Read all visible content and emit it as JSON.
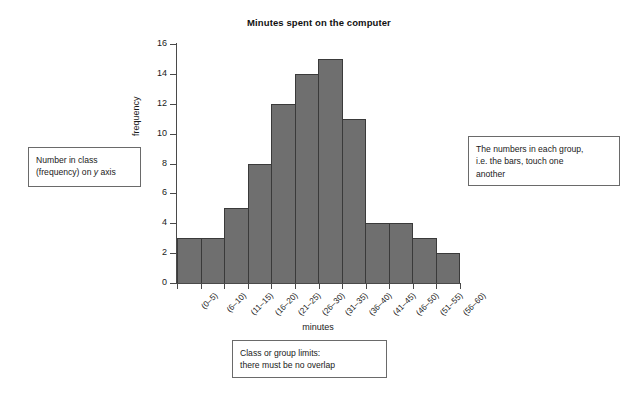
{
  "chart_data": {
    "type": "bar",
    "title": "Minutes spent on the computer",
    "xlabel": "minutes",
    "ylabel": "frequency",
    "categories": [
      "(0–5)",
      "(6–10)",
      "(11–15)",
      "(16–20)",
      "(21–25)",
      "(26–30)",
      "(31–35)",
      "(36–40)",
      "(41–45)",
      "(46–50)",
      "(51–55)",
      "(56–60)"
    ],
    "values": [
      3,
      3,
      5,
      8,
      12,
      14,
      15,
      11,
      4,
      4,
      3,
      2
    ],
    "ylim": [
      0,
      16
    ],
    "yticks": [
      0,
      2,
      4,
      6,
      8,
      10,
      12,
      14,
      16
    ],
    "grid": false,
    "legend": false,
    "bar_color": "#6f6f6f",
    "bar_edge_color": "#3a3a3a",
    "axis_color": "#4a4a4a"
  },
  "annotations": {
    "left": {
      "line1": "Number in class",
      "line2_prefix": "(frequency) on ",
      "line2_italic": "y",
      "line2_suffix": " axis"
    },
    "right": {
      "line1": "The numbers in each group,",
      "line2": "i.e. the bars, touch one",
      "line3": "another"
    },
    "bottom": {
      "line1": "Class or group limits:",
      "line2": "there must be no overlap"
    }
  }
}
